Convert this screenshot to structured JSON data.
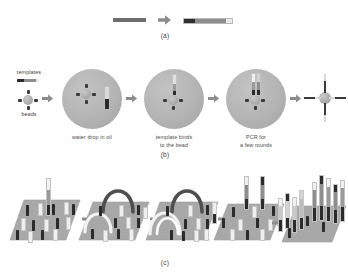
{
  "figure": {
    "title_text": "",
    "panels": [
      {
        "id": "a",
        "label": "(a)"
      },
      {
        "id": "b",
        "label": "(b)"
      },
      {
        "id": "c",
        "label": "(c)"
      }
    ]
  },
  "panel_a": {
    "label": "(a)",
    "items": [
      {
        "name": "single-strand-template",
        "color": "#6e6e6e"
      },
      {
        "name": "process-arrow",
        "color": "#8d8d8d"
      },
      {
        "name": "adapter-ligated-template",
        "colors": [
          "#2f2f2f",
          "#8e8e8e",
          "#e8e8e8"
        ]
      }
    ]
  },
  "panel_b": {
    "label": "(b)",
    "side_labels": {
      "templates": "templates",
      "beads": "beads"
    },
    "captions": [
      "water drop in oil",
      "template binds\nto the bead",
      "PCR for\na few rounds"
    ],
    "steps": [
      {
        "name": "water-drop-in-oil",
        "caption": "water drop in oil"
      },
      {
        "name": "template-binds-to-bead",
        "caption": "template binds\nto the bead"
      },
      {
        "name": "pcr-a-few-rounds",
        "caption": "PCR for\na few rounds"
      },
      {
        "name": "clonal-bead-product",
        "caption": ""
      }
    ],
    "colors": {
      "droplet": "#b4b4b4",
      "bead": "#ababab",
      "strand_dark": "#3a3a3a",
      "strand_light": "#dcdcdc",
      "arrow": "#8d8d8d"
    }
  },
  "panel_c": {
    "label": "(c)",
    "slides": [
      {
        "name": "flowcell-lawn-of-primers"
      },
      {
        "name": "bridge-formation-first"
      },
      {
        "name": "bridge-amplification"
      },
      {
        "name": "denaturation-strands"
      },
      {
        "name": "clonal-clusters"
      }
    ],
    "colors": {
      "surface": "#a8a8a8",
      "primer_dark": "#2b2b2b",
      "primer_light": "#efefef",
      "bridge_dark": "#4f4f4f",
      "bridge_light": "#f2f2f2",
      "arrow": "#8d8d8d"
    }
  }
}
